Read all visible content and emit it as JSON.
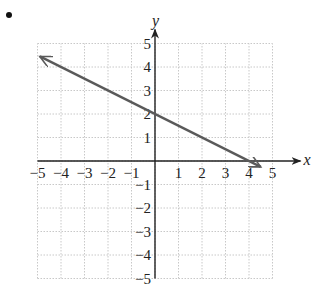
{
  "bullet": "•",
  "chart_data": {
    "type": "line",
    "title": "",
    "xlabel": "x",
    "ylabel": "y",
    "xlim": [
      -5,
      5
    ],
    "ylim": [
      -5,
      5
    ],
    "grid": true,
    "x_ticks": [
      -5,
      -4,
      -3,
      -2,
      -1,
      1,
      2,
      3,
      4,
      5
    ],
    "y_ticks": [
      -5,
      -4,
      -3,
      -2,
      -1,
      1,
      2,
      3,
      4,
      5
    ],
    "x_tick_labels": [
      "−5",
      "−4",
      "−3",
      "−2",
      "−1",
      "1",
      "2",
      "3",
      "4",
      "5"
    ],
    "y_tick_labels": [
      "−5",
      "−4",
      "−3",
      "−2",
      "−1",
      "1",
      "2",
      "3",
      "4",
      "5"
    ],
    "series": [
      {
        "name": "line",
        "equation": "y = -0.5x + 2",
        "slope": -0.5,
        "y_intercept": 2,
        "x_intercept": 4,
        "x": [
          -4.9,
          4.5
        ],
        "y": [
          4.45,
          -0.25
        ],
        "arrows": "both",
        "color": "#555555"
      }
    ]
  },
  "colors": {
    "grid": "#c8c8c8",
    "axis": "#222222",
    "line": "#5a5a5a"
  }
}
